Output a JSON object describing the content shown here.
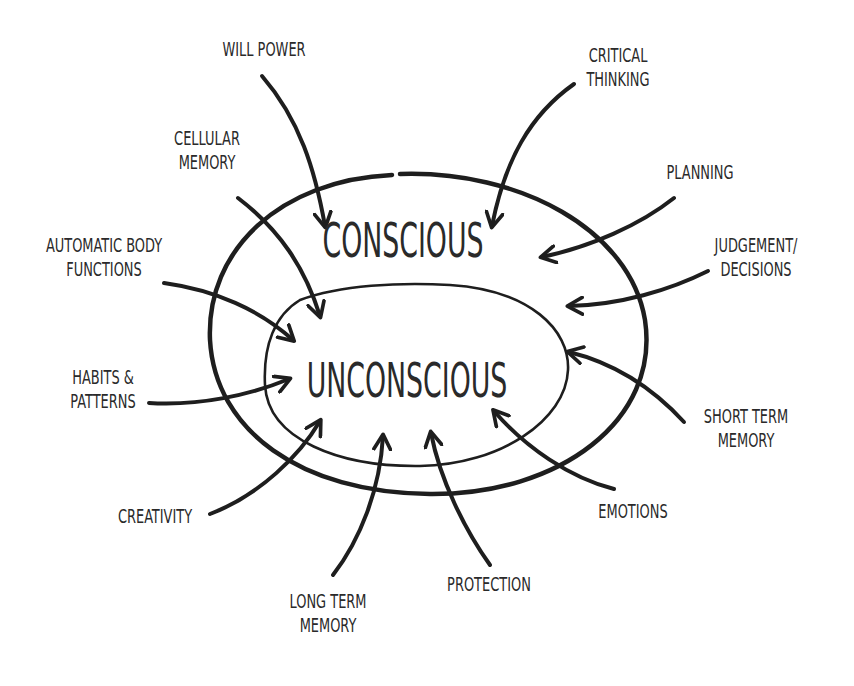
{
  "diagram": {
    "outer_label": "CONSCIOUS",
    "inner_label": "UNCONSCIOUS",
    "conscious_inputs": [
      {
        "id": "critical-thinking",
        "text": "CRITICAL\nTHINKING"
      },
      {
        "id": "planning",
        "text": "PLANNING"
      },
      {
        "id": "judgement-decisions",
        "text": "JUDGEMENT/\nDECISIONS"
      },
      {
        "id": "short-term-memory",
        "text": "SHORT TERM\nMEMORY"
      },
      {
        "id": "will-power",
        "text": "WILL POWER"
      }
    ],
    "unconscious_inputs": [
      {
        "id": "cellular-memory",
        "text": "CELLULAR\nMEMORY"
      },
      {
        "id": "automatic-body-functions",
        "text": "AUTOMATIC BODY\nFUNCTIONS"
      },
      {
        "id": "habits-patterns",
        "text": "HABITS &\nPATTERNS"
      },
      {
        "id": "creativity",
        "text": "CREATIVITY"
      },
      {
        "id": "long-term-memory",
        "text": "LONG TERM\nMEMORY"
      },
      {
        "id": "protection",
        "text": "PROTECTION"
      },
      {
        "id": "emotions",
        "text": "EMOTIONS"
      }
    ],
    "line_color": "#1e1e1e",
    "text_color": "#2a2a2a"
  }
}
